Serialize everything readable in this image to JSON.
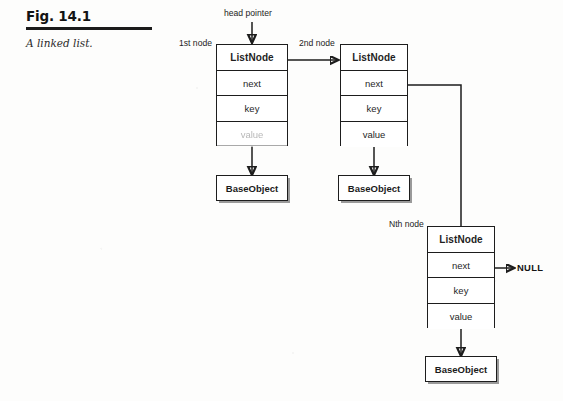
{
  "figure": {
    "number": "Fig. 14.1",
    "title": "A linked list.",
    "head_pointer_label": "head pointer",
    "null_label": "NULL"
  },
  "labels": {
    "first_node": "1st node",
    "second_node": "2nd node",
    "nth_node": "Nth node"
  },
  "nodes": [
    {
      "position_label": "1st node",
      "header": "ListNode",
      "fields": [
        "next",
        "key",
        "value"
      ],
      "target": "BaseObject"
    },
    {
      "position_label": "2nd node",
      "header": "ListNode",
      "fields": [
        "next",
        "key",
        "value"
      ],
      "target": "BaseObject"
    },
    {
      "position_label": "Nth node",
      "header": "ListNode",
      "fields": [
        "next",
        "key",
        "value"
      ],
      "target": "BaseObject"
    }
  ],
  "base_objects": [
    "BaseObject",
    "BaseObject",
    "BaseObject"
  ],
  "colors": {
    "ink": "#1d1d1d",
    "paper": "#fdfdfc",
    "shadow": "#9a9a9a"
  }
}
